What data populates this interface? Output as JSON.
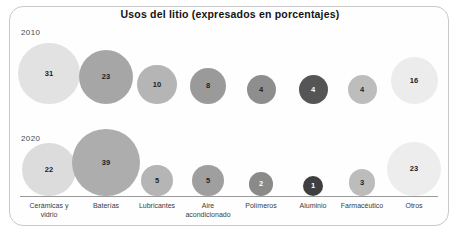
{
  "chart_data": {
    "type": "scatter",
    "title": "Usos del litio (expresados en porcentajes)",
    "xlabel": "",
    "ylabel": "",
    "categories": [
      "Cerámicas y vidrio",
      "Baterías",
      "Lubricantes",
      "Aire acondicionado",
      "Polímeros",
      "Aluminio",
      "Farmacéutico",
      "Otros"
    ],
    "series": [
      {
        "name": "2010",
        "values": [
          31,
          23,
          10,
          8,
          4,
          4,
          4,
          16
        ]
      },
      {
        "name": "2020",
        "values": [
          22,
          39,
          5,
          5,
          2,
          1,
          3,
          23
        ]
      }
    ],
    "units": "porcentaje",
    "legend_position": "left-inline",
    "grid": false,
    "bubble_colors_2010": [
      "#e2e2e2",
      "#a6a6a6",
      "#b5b5b5",
      "#9a9a9a",
      "#8e8e8e",
      "#555555",
      "#bdbdbd",
      "#ececec"
    ],
    "bubble_colors_2020": [
      "#dcdcdc",
      "#adadad",
      "#b5b5b5",
      "#9f9f9f",
      "#8a8a8a",
      "#3f3f3f",
      "#bcbcbc",
      "#ededed"
    ]
  },
  "frame": {
    "border_color": "#c8c8c8",
    "background": "#fefefe"
  },
  "rows": [
    {
      "year": "2010"
    },
    {
      "year": "2020"
    }
  ]
}
